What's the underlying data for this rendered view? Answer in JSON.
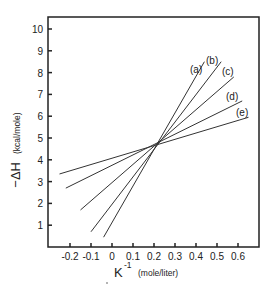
{
  "chart_data": {
    "type": "line",
    "title": "",
    "xlabel": "K⁻¹ (mole/liter)",
    "xlabel_main": "K",
    "xlabel_sup": "-1",
    "xlabel_unit": "(mole/liter)",
    "ylabel": "−ΔH (kcal/mole)",
    "ylabel_main": "−ΔH",
    "ylabel_unit": "(kcal/mole)",
    "xlim": [
      -0.3,
      0.7
    ],
    "ylim": [
      0,
      10
    ],
    "x_ticks": [
      -0.2,
      -0.1,
      0,
      0.1,
      0.2,
      0.3,
      0.4,
      0.5,
      0.6
    ],
    "x_tick_labels": [
      "-0.2",
      "-0.1",
      "0",
      "0.1",
      "0.2",
      "0.3",
      "0.4",
      "0.5",
      "0.6"
    ],
    "y_ticks": [
      1,
      2,
      3,
      4,
      5,
      6,
      7,
      8,
      9,
      10
    ],
    "y_tick_labels": [
      "1",
      "2",
      "3",
      "4",
      "5",
      "6",
      "7",
      "8",
      "9",
      "10"
    ],
    "grid": false,
    "legend": "inline labels at line ends",
    "intersection": {
      "x": 0.23,
      "y": 4.8
    },
    "series": [
      {
        "name": "(a)",
        "x": [
          -0.04,
          0.44
        ],
        "y": [
          0.45,
          8.5
        ]
      },
      {
        "name": "(b)",
        "x": [
          -0.1,
          0.52
        ],
        "y": [
          0.7,
          8.5
        ]
      },
      {
        "name": "(c)",
        "x": [
          -0.15,
          0.58
        ],
        "y": [
          1.7,
          7.8
        ]
      },
      {
        "name": "(d)",
        "x": [
          -0.22,
          0.62
        ],
        "y": [
          2.7,
          6.7
        ]
      },
      {
        "name": "(e)",
        "x": [
          -0.25,
          0.65
        ],
        "y": [
          3.35,
          5.95
        ]
      }
    ]
  }
}
